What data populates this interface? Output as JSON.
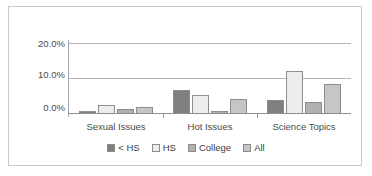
{
  "chart_data": {
    "type": "bar",
    "title": "",
    "xlabel": "",
    "ylabel": "",
    "ylim": [
      0,
      25
    ],
    "yticks": [
      0,
      10,
      20
    ],
    "ytick_labels": [
      "0.0%",
      "10.0%",
      "20.0%"
    ],
    "grid": true,
    "legend_position": "bottom",
    "categories": [
      "Sexual Issues",
      "Hot Issues",
      "Science Topics"
    ],
    "series": [
      {
        "name": "< HS",
        "color": "#808080",
        "values": [
          1.1,
          8.3,
          4.8
        ]
      },
      {
        "name": "HS",
        "color": "#ececec",
        "values": [
          3.2,
          6.8,
          15.0
        ]
      },
      {
        "name": "College",
        "color": "#b0b0b0",
        "values": [
          1.7,
          1.2,
          4.1
        ]
      },
      {
        "name": "All",
        "color": "#c6c6c6",
        "values": [
          2.5,
          5.2,
          10.7
        ]
      }
    ]
  },
  "style": {
    "border_color": "#c9c9c9",
    "gridline_color": "#b5b5b5",
    "axis_color": "#8f8f8f",
    "bar_outline": "#8c8c8c",
    "text_color": "#4a4a4a"
  }
}
